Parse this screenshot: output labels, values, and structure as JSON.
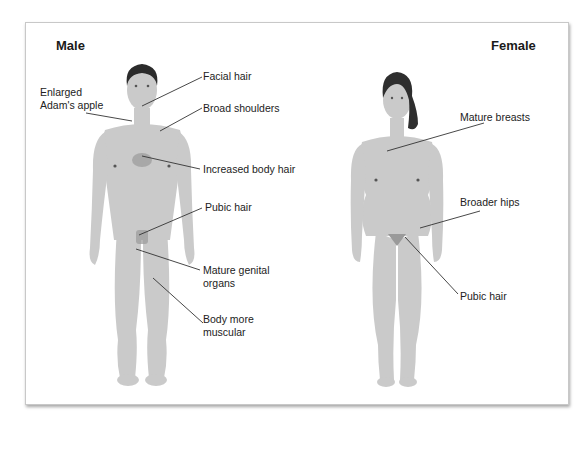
{
  "diagram": {
    "colors": {
      "skin": "#c9c9c9",
      "skin_shade": "#b4b4b4",
      "hair": "#2b2b2b",
      "pubic": "#8a8a8a",
      "leader": "#333333",
      "frame_border": "#c8c8c8"
    },
    "male": {
      "title": "Male",
      "labels": [
        {
          "id": "facial-hair",
          "text": "Facial hair"
        },
        {
          "id": "adams-apple",
          "text": "Enlarged\nAdam's apple"
        },
        {
          "id": "broad-shoulders",
          "text": "Broad shoulders"
        },
        {
          "id": "body-hair",
          "text": "Increased body hair"
        },
        {
          "id": "pubic-hair",
          "text": "Pubic hair"
        },
        {
          "id": "genital-organs",
          "text": "Mature genital\norgans"
        },
        {
          "id": "muscular",
          "text": "Body more\nmuscular"
        }
      ]
    },
    "female": {
      "title": "Female",
      "labels": [
        {
          "id": "breasts",
          "text": "Mature breasts"
        },
        {
          "id": "hips",
          "text": "Broader hips"
        },
        {
          "id": "pubic-hair",
          "text": "Pubic hair"
        }
      ]
    }
  }
}
